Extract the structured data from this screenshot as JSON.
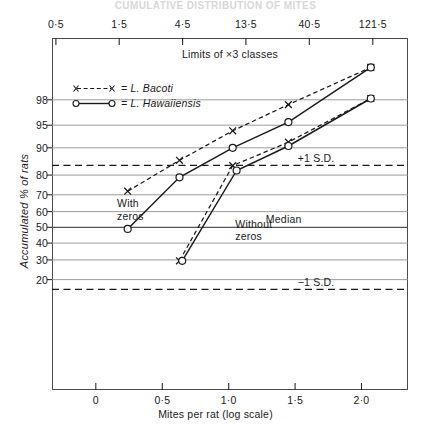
{
  "figure": {
    "faded_title": "CUMULATIVE  DISTRIBUTION  OF  MITES",
    "top_axis_caption": "Limits of ×3 classes",
    "x_axis_title": "Mites per rat  (log scale)",
    "y_axis_title": "Accumulated % of rats"
  },
  "legend": {
    "items": [
      {
        "label": "= L. Bacoti",
        "marker": "cross",
        "line": "dashed"
      },
      {
        "label": "= L. Hawaiiensis",
        "marker": "circle",
        "line": "solid"
      }
    ]
  },
  "annotations": {
    "with_zeros_line1": "With",
    "with_zeros_line2": "zeros",
    "without_zeros_line1": "Without",
    "without_zeros_line2": "zeros",
    "plus_1sd": "+1 S.D.",
    "minus_1sd": "−1 S.D.",
    "median": "Median"
  },
  "chart_data": {
    "type": "line",
    "subtitle": "Probit / normal-probability ordinate; abscissa log10(mites per rat)",
    "xlabel": "Mites per rat  (log scale)",
    "ylabel": "Accumulated % of rats",
    "grid": true,
    "legend_position": "upper-left-inside",
    "xlim": [
      -0.33,
      2.35
    ],
    "x_ticks": [
      "0",
      "0·5",
      "1·0",
      "1·5",
      "2·0"
    ],
    "x_tick_values": [
      0,
      0.5,
      1.0,
      1.5,
      2.0
    ],
    "top_axis": {
      "caption": "Limits of ×3 classes",
      "tick_labels": [
        "0·5",
        "1·5",
        "4·5",
        "13·5",
        "40·5",
        "121·5"
      ],
      "tick_values": [
        0.5,
        1.5,
        4.5,
        13.5,
        40.5,
        121.5
      ],
      "tick_log10": [
        -0.301,
        0.176,
        0.653,
        1.13,
        1.607,
        2.085
      ]
    },
    "y_ticks": [
      "98",
      "95",
      "90",
      "80",
      "70",
      "60",
      "50",
      "40",
      "30",
      "20"
    ],
    "y_tick_values": [
      98,
      95,
      90,
      80,
      70,
      60,
      50,
      40,
      30,
      20
    ],
    "reference_lines": [
      {
        "name": "+1 S.D.",
        "y_percent": 84.1,
        "style": "dashed",
        "label": "+1 S.D."
      },
      {
        "name": "Median",
        "y_percent": 50,
        "style": "solid",
        "label": "Median"
      },
      {
        "name": "-1 S.D.",
        "y_percent": 15.9,
        "style": "dashed",
        "label": "−1 S.D."
      }
    ],
    "series": [
      {
        "name": "L. Bacoti (with zeros)",
        "marker": "cross",
        "line": "dashed",
        "points": [
          {
            "x": 0.24,
            "y": 72
          },
          {
            "x": 0.63,
            "y": 86
          },
          {
            "x": 1.03,
            "y": 94
          },
          {
            "x": 1.45,
            "y": 97.6
          },
          {
            "x": 2.07,
            "y": 99.5
          }
        ]
      },
      {
        "name": "L. Hawaiiensis (with zeros)",
        "marker": "circle",
        "line": "solid",
        "points": [
          {
            "x": 0.24,
            "y": 49
          },
          {
            "x": 0.63,
            "y": 79
          },
          {
            "x": 1.03,
            "y": 90
          },
          {
            "x": 1.45,
            "y": 95.5
          },
          {
            "x": 2.07,
            "y": 99.5
          }
        ]
      },
      {
        "name": "L. Bacoti (without zeros)",
        "marker": "cross",
        "line": "dashed",
        "points": [
          {
            "x": 0.63,
            "y": 29.5
          },
          {
            "x": 1.03,
            "y": 84
          },
          {
            "x": 1.45,
            "y": 91.5
          },
          {
            "x": 2.07,
            "y": 98.1
          }
        ]
      },
      {
        "name": "L. Hawaiiensis (without zeros)",
        "marker": "circle",
        "line": "solid",
        "points": [
          {
            "x": 0.65,
            "y": 29.5
          },
          {
            "x": 1.06,
            "y": 82
          },
          {
            "x": 1.45,
            "y": 90.5
          },
          {
            "x": 2.07,
            "y": 98.1
          }
        ]
      }
    ],
    "colors": {
      "ink": "#1a1a1a",
      "frame": "#4a4a4a",
      "gridline": "#8b8b8b",
      "background": "#ffffff"
    }
  }
}
